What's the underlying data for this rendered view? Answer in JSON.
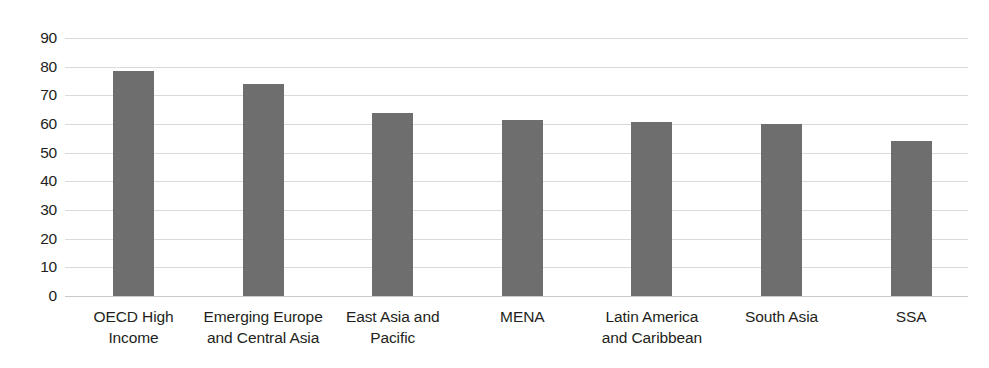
{
  "chart_data": {
    "type": "bar",
    "title": "",
    "subtitle": "",
    "xlabel": "",
    "ylabel": "",
    "categories": [
      "OECD High\nIncome",
      "Emerging Europe\nand Central Asia",
      "East Asia and\nPacific",
      "MENA",
      "Latin America\nand Caribbean",
      "South Asia",
      "SSA"
    ],
    "values": [
      78.5,
      74,
      64,
      61.5,
      60.7,
      60,
      54
    ],
    "ylim": [
      0,
      90
    ],
    "yticks": [
      0,
      10,
      20,
      30,
      40,
      50,
      60,
      70,
      80,
      90
    ],
    "ytick_labels": [
      "0",
      "10",
      "20",
      "30",
      "40",
      "50",
      "60",
      "70",
      "80",
      "90"
    ],
    "grid": true,
    "legend": "none",
    "bar_color": "#6e6e6e",
    "grid_color": "#d9dadb",
    "background": "#ffffff",
    "annotations": []
  }
}
